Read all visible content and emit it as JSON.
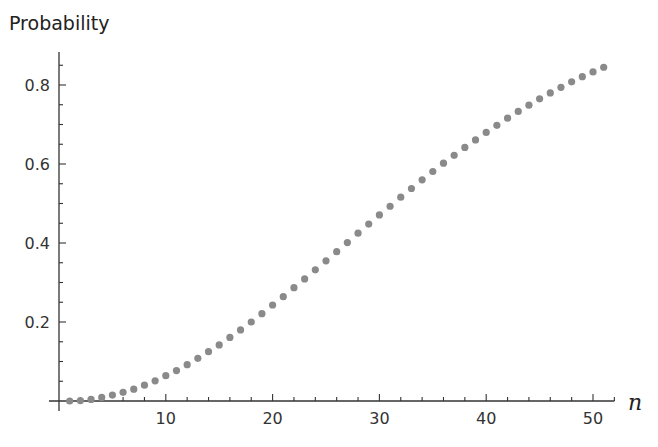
{
  "chart_data": {
    "type": "scatter",
    "title": "",
    "xlabel": "n",
    "ylabel": "Probability",
    "xlim": [
      0,
      52
    ],
    "ylim": [
      0,
      0.88
    ],
    "grid": false,
    "legend": null,
    "x_ticks": [
      10,
      20,
      30,
      40,
      50
    ],
    "x_tick_labels": [
      "10",
      "20",
      "30",
      "40",
      "50"
    ],
    "y_ticks": [
      0.2,
      0.4,
      0.6,
      0.8
    ],
    "y_tick_labels": [
      "0.2",
      "0.4",
      "0.6",
      "0.8"
    ],
    "marker_color": "#8a8a8a",
    "series": [
      {
        "name": "Probability",
        "x": [
          1,
          2,
          3,
          4,
          5,
          6,
          7,
          8,
          9,
          10,
          11,
          12,
          13,
          14,
          15,
          16,
          17,
          18,
          19,
          20,
          21,
          22,
          23,
          24,
          25,
          26,
          27,
          28,
          29,
          30,
          31,
          32,
          33,
          34,
          35,
          36,
          37,
          38,
          39,
          40,
          41,
          42,
          43,
          44,
          45,
          46,
          47,
          48,
          49,
          50,
          51
        ],
        "values": [
          0.0,
          0.001,
          0.004,
          0.009,
          0.015,
          0.022,
          0.03,
          0.04,
          0.051,
          0.064,
          0.077,
          0.092,
          0.108,
          0.125,
          0.142,
          0.161,
          0.18,
          0.2,
          0.221,
          0.243,
          0.264,
          0.287,
          0.309,
          0.332,
          0.355,
          0.378,
          0.401,
          0.425,
          0.448,
          0.471,
          0.493,
          0.516,
          0.538,
          0.56,
          0.581,
          0.602,
          0.622,
          0.642,
          0.661,
          0.68,
          0.698,
          0.716,
          0.733,
          0.749,
          0.765,
          0.78,
          0.794,
          0.808,
          0.821,
          0.833,
          0.845
        ]
      }
    ]
  }
}
